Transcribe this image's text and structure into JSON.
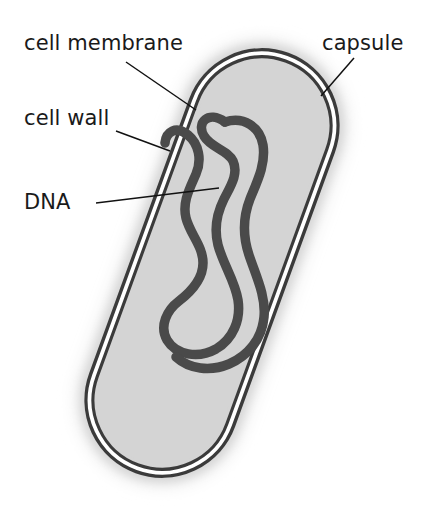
{
  "diagram": {
    "background_color": "#ffffff"
  },
  "labels": {
    "cell_membrane": "cell membrane",
    "cell_wall": "cell wall",
    "dna": "DNA",
    "capsule": "capsule"
  },
  "colors": {
    "capsule_halo": "#d9d9d9",
    "capsule_halo_outer": "#e8e8e8",
    "cell_wall_line": "#3b3b3b",
    "cell_membrane_line": "#3b3b3b",
    "cytoplasm": "#d4d4d4",
    "dna_strand": "#4a4a4a",
    "leader_line": "#111111",
    "label_text": "#1a1a1a"
  },
  "structures": [
    {
      "name": "capsule",
      "description": "outermost diffuse grey halo surrounding the cell"
    },
    {
      "name": "cell wall",
      "description": "outer dark boundary line of the rod-shaped cell"
    },
    {
      "name": "cell membrane",
      "description": "inner dark boundary line just inside the cell wall"
    },
    {
      "name": "cytoplasm",
      "description": "light grey interior fill of the cell"
    },
    {
      "name": "DNA",
      "description": "dark serpentine closed loop of nucleoid DNA in the cytoplasm"
    }
  ],
  "leader_lines": [
    {
      "name": "cell-membrane-leader",
      "from": [
        126,
        62
      ],
      "to": [
        196,
        110
      ]
    },
    {
      "name": "cell-wall-leader",
      "from": [
        116,
        131
      ],
      "to": [
        170,
        151
      ]
    },
    {
      "name": "dna-leader",
      "from": [
        96,
        203
      ],
      "to": [
        219,
        188
      ]
    },
    {
      "name": "capsule-leader",
      "from": [
        354,
        58
      ],
      "to": [
        321,
        96
      ]
    }
  ]
}
